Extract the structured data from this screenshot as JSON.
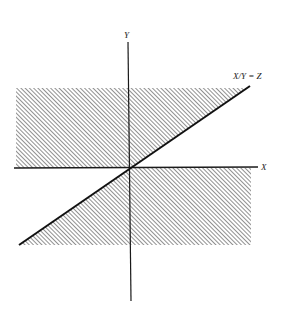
{
  "diagram": {
    "axes": {
      "x_label": "X",
      "y_label": "Y"
    },
    "line_label": "X/Y = Z",
    "regions": [
      {
        "name": "upper-left-shaded",
        "description": "Region above X axis, left of line X/Y = Z"
      },
      {
        "name": "lower-right-shaded",
        "description": "Region below X axis, right of line X/Y = Z"
      }
    ],
    "colors": {
      "ink": "#1a1a1a",
      "hatch": "#555555",
      "background": "#ffffff"
    }
  }
}
